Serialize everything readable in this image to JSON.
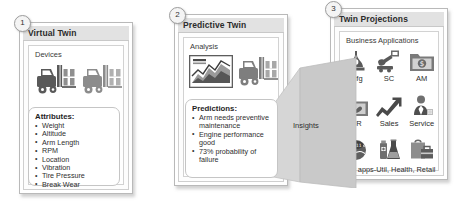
{
  "panels": [
    {
      "number": "1",
      "title": "Virtual Twin",
      "sub_label": "Devices",
      "callout": {
        "heading": "Attributes:",
        "items": [
          "Weight",
          "Altitude",
          "Arm Length",
          "RPM",
          "Location",
          "Vibration",
          "Tire Pressure",
          "Break Wear"
        ]
      },
      "icons": [
        "forklift-icon",
        "forklift-icon"
      ]
    },
    {
      "number": "2",
      "title": "Predictive Twin",
      "sub_label": "Analysis",
      "callout": {
        "heading": "Predictions:",
        "items": [
          "Arm needs preventive maintenance",
          "Engine performance good",
          "73% probability of failure"
        ]
      },
      "icons": [
        "area-chart-icon",
        "forklift-icon"
      ]
    },
    {
      "number": "3",
      "title": "Twin Projections",
      "sub_label": "Business Applications",
      "apps": [
        {
          "label": "Mfg",
          "icon": "factory-icon"
        },
        {
          "label": "SC",
          "icon": "crane-icon"
        },
        {
          "label": "AM",
          "icon": "asset-folder-icon"
        },
        {
          "label": "CR",
          "icon": "crm-folder-icon"
        },
        {
          "label": "Sales",
          "icon": "growth-arrow-icon"
        },
        {
          "label": "Service",
          "icon": "service-agent-icon"
        },
        {
          "label": "",
          "icon": "utility-gauge-icon"
        },
        {
          "label": "",
          "icon": "health-flask-icon"
        },
        {
          "label": "",
          "icon": "retail-bag-icon"
        }
      ],
      "vertical_caption": "Vert apps-Util, Health, Retail"
    }
  ],
  "connector": {
    "label": "Insights"
  },
  "colors": {
    "panel_border": "#b9b9b9",
    "title_bar": "#e2e2e2",
    "icon_dark": "#4f4f4f",
    "icon_mid": "#8a8a8a",
    "icon_light": "#b5b5b5",
    "ribbon": "#cdcdcd",
    "text": "#2b2b2b"
  }
}
